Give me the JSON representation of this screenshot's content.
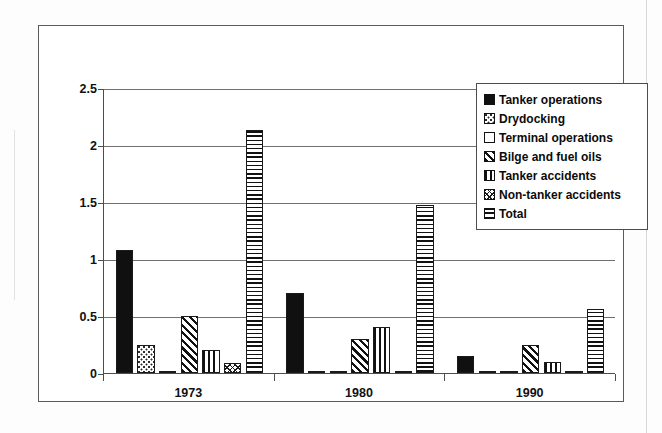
{
  "chart_data": {
    "type": "bar",
    "title": "",
    "subtitle": "",
    "xlabel": "",
    "ylabel": "",
    "categories": [
      "1973",
      "1980",
      "1990"
    ],
    "ylim": [
      0,
      2.5
    ],
    "yticks": [
      "0",
      "0.5",
      "1",
      "1.5",
      "2",
      "2.5"
    ],
    "ytick_values": [
      0,
      0.5,
      1,
      1.5,
      2,
      2.5
    ],
    "grid": true,
    "legend_position": "top-right",
    "series": [
      {
        "name": "Tanker operations",
        "pattern": "solid",
        "values": [
          1.08,
          0.7,
          0.15
        ]
      },
      {
        "name": "Drydocking",
        "pattern": "dots",
        "values": [
          0.25,
          0.0,
          0.0
        ]
      },
      {
        "name": "Terminal operations",
        "pattern": "empty",
        "values": [
          0.01,
          0.02,
          0.02
        ]
      },
      {
        "name": "Bilge and fuel oils",
        "pattern": "diag",
        "values": [
          0.5,
          0.3,
          0.25
        ]
      },
      {
        "name": "Tanker accidents",
        "pattern": "vert",
        "values": [
          0.2,
          0.4,
          0.1
        ]
      },
      {
        "name": "Non-tanker accidents",
        "pattern": "crossdiag",
        "values": [
          0.09,
          0.02,
          0.01
        ]
      },
      {
        "name": "Total",
        "pattern": "horiz",
        "values": [
          2.13,
          1.47,
          0.56
        ]
      }
    ]
  },
  "legend": {
    "items": [
      {
        "label": "Tanker operations",
        "pattern": "solid"
      },
      {
        "label": "Drydocking",
        "pattern": "dots"
      },
      {
        "label": "Terminal operations",
        "pattern": "empty"
      },
      {
        "label": "Bilge and fuel oils",
        "pattern": "diag"
      },
      {
        "label": "Tanker accidents",
        "pattern": "vert"
      },
      {
        "label": "Non-tanker accidents",
        "pattern": "crossdiag"
      },
      {
        "label": "Total",
        "pattern": "horiz"
      }
    ]
  },
  "colors": {
    "fill": "#101010",
    "outline": "#1a1a1a",
    "axis": "#4d4d4d",
    "grid": "#707070",
    "frame": "#5a5a5a",
    "background": "#ffffff"
  }
}
